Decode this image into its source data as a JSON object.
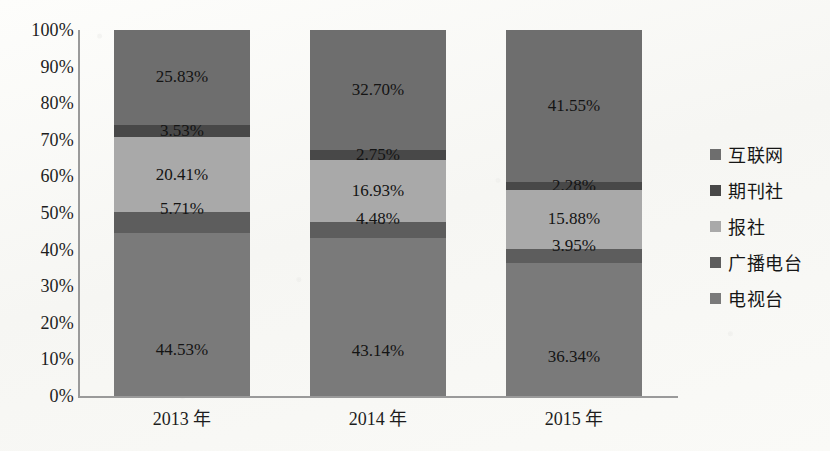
{
  "chart_data": {
    "type": "bar",
    "subtype": "100% stacked bar",
    "title": "",
    "xlabel": "",
    "ylabel": "",
    "ylim": [
      0,
      100
    ],
    "grid": false,
    "legend_position": "right",
    "categories": [
      "2013 年",
      "2014 年",
      "2015 年"
    ],
    "y_ticks": [
      "0%",
      "10%",
      "20%",
      "30%",
      "40%",
      "50%",
      "60%",
      "70%",
      "80%",
      "90%",
      "100%"
    ],
    "stack_order_top_to_bottom": [
      "互联网",
      "期刊社",
      "报社",
      "广播电台",
      "电视台"
    ],
    "series": [
      {
        "name": "互联网",
        "color": "#6e6e6e",
        "values": [
          25.83,
          32.7,
          41.55
        ],
        "labels": [
          "25.83%",
          "32.70%",
          "41.55%"
        ]
      },
      {
        "name": "期刊社",
        "color": "#484848",
        "values": [
          3.53,
          2.75,
          2.28
        ],
        "labels": [
          "3.53%",
          "2.75%",
          "2.28%"
        ]
      },
      {
        "name": "报社",
        "color": "#a9a9a9",
        "values": [
          20.41,
          16.93,
          15.88
        ],
        "labels": [
          "20.41%",
          "16.93%",
          "15.88%"
        ]
      },
      {
        "name": "广播电台",
        "color": "#5d5d5d",
        "values": [
          5.71,
          4.48,
          3.95
        ],
        "labels": [
          "5.71%",
          "4.48%",
          "3.95%"
        ]
      },
      {
        "name": "电视台",
        "color": "#7a7a7a",
        "values": [
          44.53,
          43.14,
          36.34
        ],
        "labels": [
          "44.53%",
          "43.14%",
          "36.34%"
        ]
      }
    ]
  },
  "legend": {
    "items": [
      {
        "label": "互联网",
        "color": "#6e6e6e"
      },
      {
        "label": "期刊社",
        "color": "#484848"
      },
      {
        "label": "报社",
        "color": "#a9a9a9"
      },
      {
        "label": "广播电台",
        "color": "#5d5d5d"
      },
      {
        "label": "电视台",
        "color": "#7a7a7a"
      }
    ]
  }
}
